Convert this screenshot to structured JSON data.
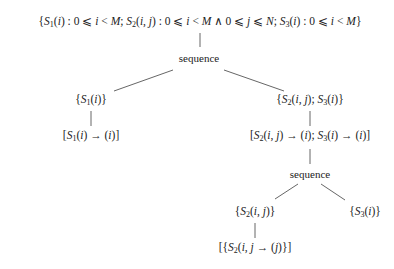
{
  "diagram": {
    "type": "schedule-tree",
    "nodes": [
      {
        "id": "root",
        "label": "{S1(i) : 0 ⩽ i < M; S2(i, j) : 0 ⩽ i < M ∧ 0 ⩽ j ⩽ N; S3(i) : 0 ⩽ i < M}"
      },
      {
        "id": "seq1",
        "label": "sequence"
      },
      {
        "id": "filter_s1",
        "label": "{S1(i)}"
      },
      {
        "id": "band_s1",
        "label": "[S1(i) → (i)]"
      },
      {
        "id": "filter_s2s3",
        "label": "{S2(i, j); S3(i)}"
      },
      {
        "id": "band_s2s3",
        "label": "[S2(i, j) → (i); S3(i) → (i)]"
      },
      {
        "id": "seq2",
        "label": "sequence"
      },
      {
        "id": "filter_s2",
        "label": "{S2(i, j)}"
      },
      {
        "id": "band_s2",
        "label": "[{S2(i, j → (j)}]"
      },
      {
        "id": "filter_s3",
        "label": "{S3(i)}"
      }
    ],
    "edges": [
      [
        "root",
        "seq1"
      ],
      [
        "seq1",
        "filter_s1"
      ],
      [
        "seq1",
        "filter_s2s3"
      ],
      [
        "filter_s1",
        "band_s1"
      ],
      [
        "filter_s2s3",
        "band_s2s3"
      ],
      [
        "band_s2s3",
        "seq2"
      ],
      [
        "seq2",
        "filter_s2"
      ],
      [
        "seq2",
        "filter_s3"
      ],
      [
        "filter_s2",
        "band_s2"
      ]
    ]
  },
  "labels": {
    "seq1": "sequence",
    "seq2": "sequence"
  },
  "colors": {
    "line": "#555555",
    "text": "#222222",
    "background": "#ffffff"
  }
}
